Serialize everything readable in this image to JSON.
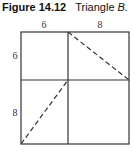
{
  "caption": {
    "prefix": "Figure 14.12",
    "text": "Triangle ",
    "var": "B."
  },
  "diagram": {
    "top_labels": [
      "6",
      "8"
    ],
    "side_labels": [
      "6",
      "8"
    ],
    "stroke_color": "#333333"
  }
}
